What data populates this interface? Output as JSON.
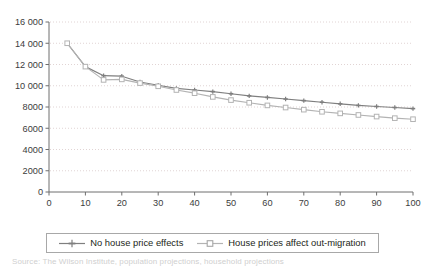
{
  "chart_data": {
    "type": "line",
    "title": "",
    "subtitle": "",
    "xlabel": "",
    "ylabel": "",
    "xlim": [
      0,
      100
    ],
    "ylim": [
      0,
      16000
    ],
    "xticks": [
      "0",
      "10",
      "20",
      "30",
      "40",
      "50",
      "60",
      "70",
      "80",
      "90",
      "100"
    ],
    "xtick_values": [
      0,
      10,
      20,
      30,
      40,
      50,
      60,
      70,
      80,
      90,
      100
    ],
    "yticks": [
      "0",
      "2000",
      "4000",
      "6000",
      "8000",
      "10 000",
      "12 000",
      "14 000",
      "16 000"
    ],
    "ytick_values": [
      0,
      2000,
      4000,
      6000,
      8000,
      10000,
      12000,
      14000,
      16000
    ],
    "grid": "horizontal-dotted",
    "legend_position": "bottom",
    "x": [
      5,
      10,
      15,
      20,
      25,
      30,
      35,
      40,
      45,
      50,
      55,
      60,
      65,
      70,
      75,
      80,
      85,
      90,
      95,
      100
    ],
    "series": [
      {
        "name": "No house price effects",
        "color": "#7f7f7f",
        "marker": "cross",
        "values": [
          14000,
          11800,
          10950,
          10900,
          10350,
          10050,
          9750,
          9600,
          9450,
          9250,
          9050,
          8900,
          8750,
          8600,
          8450,
          8300,
          8150,
          8050,
          7950,
          7850
        ]
      },
      {
        "name": "House prices affect out-migration",
        "color": "#b3b3b3",
        "marker": "square",
        "values": [
          14000,
          11800,
          10550,
          10600,
          10250,
          9950,
          9600,
          9300,
          8950,
          8650,
          8400,
          8150,
          7950,
          7750,
          7550,
          7400,
          7250,
          7100,
          6950,
          6850
        ]
      }
    ]
  },
  "legend": {
    "items": [
      {
        "label": "No house price effects",
        "color": "#7f7f7f",
        "marker": "cross"
      },
      {
        "label": "House prices affect out-migration",
        "color": "#b3b3b3",
        "marker": "square"
      }
    ]
  },
  "caption": {
    "sliver_text": "Source: The Wilson Institute, population projections, household projections"
  }
}
